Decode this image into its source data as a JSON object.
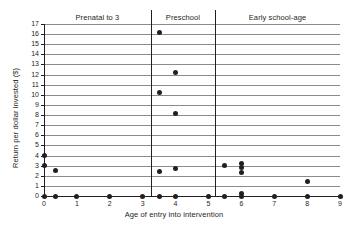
{
  "chart_data": {
    "type": "scatter",
    "title": "",
    "xlabel": "Age of entry into intervention",
    "ylabel": "Return per dollar invested ($)",
    "xlim": [
      0,
      9
    ],
    "ylim": [
      0,
      17
    ],
    "grid": true,
    "legend": "none",
    "xticks": [
      "0",
      "1",
      "2",
      "3",
      "4",
      "5",
      "6",
      "7",
      "8",
      "9"
    ],
    "yticks": [
      "0",
      "1",
      "2",
      "3",
      "4",
      "5",
      "6",
      "7",
      "8",
      "9",
      "10",
      "11",
      "12",
      "13",
      "14",
      "15",
      "16",
      "17"
    ],
    "bands": [
      {
        "label": "Prenatal to 3",
        "x_start": 0,
        "x_end": 3.25
      },
      {
        "label": "Preschool",
        "x_start": 3.25,
        "x_end": 5.2
      },
      {
        "label": "Early school-age",
        "x_start": 5.2,
        "x_end": 9
      }
    ],
    "dividers": [
      3.25,
      5.2
    ],
    "points": [
      {
        "x": 0,
        "y": 4.0
      },
      {
        "x": 0,
        "y": 3.0
      },
      {
        "x": 0,
        "y": 0
      },
      {
        "x": 0.35,
        "y": 2.5
      },
      {
        "x": 0.35,
        "y": 0
      },
      {
        "x": 1,
        "y": 0
      },
      {
        "x": 2,
        "y": 0
      },
      {
        "x": 3,
        "y": 0
      },
      {
        "x": 3.5,
        "y": 16.2
      },
      {
        "x": 3.5,
        "y": 10.2
      },
      {
        "x": 3.5,
        "y": 2.4
      },
      {
        "x": 3.5,
        "y": 0
      },
      {
        "x": 4,
        "y": 12.2
      },
      {
        "x": 4,
        "y": 8.2
      },
      {
        "x": 4,
        "y": 2.7
      },
      {
        "x": 4,
        "y": 0
      },
      {
        "x": 5,
        "y": 0
      },
      {
        "x": 5.5,
        "y": 3.0
      },
      {
        "x": 5.5,
        "y": 0
      },
      {
        "x": 6,
        "y": 3.2
      },
      {
        "x": 6,
        "y": 2.8
      },
      {
        "x": 6,
        "y": 2.3
      },
      {
        "x": 6,
        "y": 0.25
      },
      {
        "x": 6,
        "y": 0
      },
      {
        "x": 7,
        "y": 0
      },
      {
        "x": 8,
        "y": 1.4
      },
      {
        "x": 8,
        "y": 0
      },
      {
        "x": 9,
        "y": 0
      }
    ],
    "colors": {
      "point": "#231f20",
      "gridline": "#8b8b8b",
      "axis": "#231f20",
      "background": "#ffffff"
    }
  }
}
